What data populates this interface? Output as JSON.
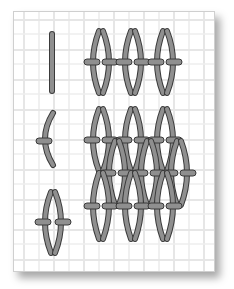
{
  "figure": {
    "colors": {
      "background": "#ffffff",
      "grid": "#e2e2e2",
      "stitch_fill": "#8f8f8f",
      "stitch_outline": "#3a3a3a"
    },
    "sections": [
      {
        "id": "row1",
        "description": "single vertical stitch, then three linked diamond stitches"
      },
      {
        "id": "row2",
        "description": "single curved stitch with tie bar, then interlocking diamond mesh"
      },
      {
        "id": "row3",
        "description": "single diamond stitch with two tie bars"
      }
    ]
  }
}
